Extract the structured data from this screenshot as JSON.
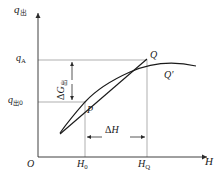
{
  "figure": {
    "type": "diagram",
    "background_color": "#ffffff",
    "line_color": "#2b2b2b",
    "grid_color": "#8c8c8c",
    "width": 220,
    "height": 177
  },
  "axes": {
    "y_axis_label": "q",
    "y_axis_subscript": "出",
    "x_axis_label": "H",
    "origin_label": "O",
    "y_ticks": [
      {
        "id": "qa",
        "label": "q",
        "sub": "A",
        "sub_style": "roman",
        "y_px": 60
      },
      {
        "id": "qc0",
        "label": "q",
        "sub": "出0",
        "sub_style": "cjk",
        "y_px": 102
      }
    ],
    "x_ticks": [
      {
        "id": "h0",
        "label": "H",
        "sub": "0",
        "sub_style": "roman",
        "x_px": 85
      },
      {
        "id": "hq",
        "label": "H",
        "sub": "Q",
        "sub_style": "roman",
        "x_px": 147
      }
    ]
  },
  "points": [
    {
      "id": "p",
      "label": "P",
      "x_px": 85,
      "y_px": 102,
      "description": "initial operating point"
    },
    {
      "id": "q",
      "label": "Q",
      "x_px": 147,
      "y_px": 60,
      "description": "point on tangent line"
    },
    {
      "id": "qp",
      "label": "Q'",
      "x_px": 147,
      "y_px": 76,
      "description": "point on actual curve"
    }
  ],
  "measurements": [
    {
      "id": "delta-g",
      "symbol": "Δ",
      "label": "G",
      "sub": "出",
      "sub_style": "cjk",
      "orientation": "vertical",
      "from_y_px": 60,
      "to_y_px": 102,
      "at_x_px": 72
    },
    {
      "id": "delta-h",
      "symbol": "Δ",
      "label": "H",
      "sub": "",
      "sub_style": "roman",
      "orientation": "horizontal",
      "from_x_px": 85,
      "to_x_px": 147,
      "at_y_px": 137
    }
  ],
  "curves": [
    {
      "id": "characteristic-curve",
      "kind": "curve",
      "description": "concave-down characteristic curve through P and Q'",
      "path": "M 60,133 C 70,119 78,110 85,102 C 96,90 112,80 130,72 C 148,64 170,60 196,66"
    },
    {
      "id": "tangent-line",
      "kind": "line",
      "description": "tangent to the curve at P extended to Q",
      "path": "M 60,134 L 147,59"
    }
  ]
}
